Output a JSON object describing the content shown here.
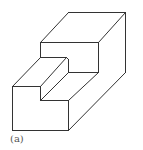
{
  "figure": {
    "caption": "(a)",
    "stroke_color": "#333333",
    "background": "#ffffff"
  },
  "geometry": {
    "visible_edges": [
      [
        [
          68,
          12
        ],
        [
          125,
          12
        ]
      ],
      [
        [
          68,
          12
        ],
        [
          40,
          42
        ]
      ],
      [
        [
          125,
          12
        ],
        [
          98,
          42
        ]
      ],
      [
        [
          125,
          12
        ],
        [
          125,
          72
        ]
      ],
      [
        [
          40,
          42
        ],
        [
          98,
          42
        ]
      ],
      [
        [
          98,
          42
        ],
        [
          98,
          72
        ]
      ],
      [
        [
          40,
          42
        ],
        [
          40,
          57
        ]
      ],
      [
        [
          40,
          57
        ],
        [
          66,
          57
        ]
      ],
      [
        [
          66,
          57
        ],
        [
          68,
          59
        ]
      ],
      [
        [
          68,
          59
        ],
        [
          68,
          72
        ]
      ],
      [
        [
          68,
          72
        ],
        [
          98,
          72
        ]
      ],
      [
        [
          40,
          57
        ],
        [
          12,
          86
        ]
      ],
      [
        [
          66,
          57
        ],
        [
          40,
          86
        ]
      ],
      [
        [
          12,
          86
        ],
        [
          40,
          86
        ]
      ],
      [
        [
          40,
          86
        ],
        [
          40,
          100
        ]
      ],
      [
        [
          40,
          100
        ],
        [
          68,
          72
        ]
      ],
      [
        [
          40,
          100
        ],
        [
          68,
          100
        ]
      ],
      [
        [
          98,
          72
        ],
        [
          68,
          100
        ]
      ],
      [
        [
          12,
          86
        ],
        [
          12,
          130
        ]
      ],
      [
        [
          12,
          130
        ],
        [
          68,
          130
        ]
      ],
      [
        [
          68,
          100
        ],
        [
          68,
          130
        ]
      ],
      [
        [
          125,
          72
        ],
        [
          68,
          130
        ]
      ]
    ]
  }
}
